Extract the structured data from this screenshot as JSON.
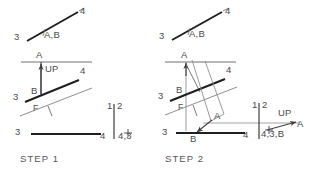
{
  "figure": {
    "title_hidden": "",
    "ink_color": "#3c3c3c",
    "light_color": "#8f8f8f",
    "bold_color": "#1f1f1f"
  },
  "steps": [
    {
      "id": "step-1",
      "caption": "STEP 1",
      "labels": {
        "top_line_left": "3",
        "top_line_right": "4",
        "top_line_points": "A,B",
        "fold_top_point": "A",
        "up_arrow": "UP",
        "mid_line_right": "4",
        "mid_line_left": "3",
        "mid_point_b": "B",
        "front_marker": "F",
        "bottom_line_left": "3",
        "bottom_line_right": "4",
        "hinge_left": "1",
        "hinge_right": "2",
        "hinge_point": "4,3"
      }
    },
    {
      "id": "step-2",
      "caption": "STEP 2",
      "labels": {
        "top_line_left": "3",
        "top_line_right": "4",
        "top_line_points": "A,B",
        "fold_top_point": "A",
        "mid_line_right": "4",
        "mid_line_left": "3",
        "mid_point_b": "B",
        "front_marker": "F",
        "point_a_lower": "A",
        "bottom_line_left": "3",
        "bottom_point_b": "B",
        "bottom_line_right": "4",
        "hinge_left": "1",
        "hinge_right": "2",
        "hinge_point": "4,3,B",
        "up_arrow": "UP",
        "up_arrow_end": "A"
      }
    }
  ]
}
